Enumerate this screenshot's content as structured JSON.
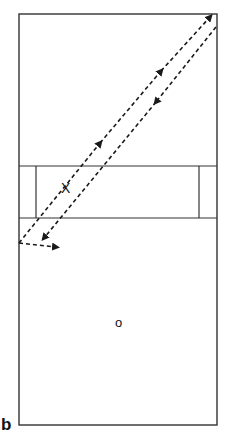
{
  "figure": {
    "panel_label": "b",
    "player_x_label": "X",
    "player_o_label": "o"
  },
  "colors": {
    "line": "#333333",
    "dash": "#1a1a1a",
    "background": "#ffffff"
  }
}
